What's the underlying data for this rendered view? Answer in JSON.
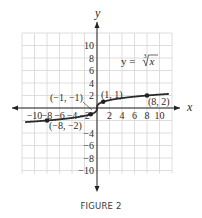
{
  "chart_data": {
    "type": "line",
    "title": "",
    "caption": "FIGURE 2",
    "xlabel": "x",
    "ylabel": "y",
    "xlim": [
      -12,
      12
    ],
    "ylim": [
      -12,
      12
    ],
    "grid": true,
    "grid_step": 2,
    "x_ticks": [
      "-10",
      "-8",
      "-6",
      "-4",
      "-2",
      "2",
      "4",
      "6",
      "8",
      "10"
    ],
    "y_ticks": [
      "10",
      "8",
      "6",
      "4",
      "2",
      "-4",
      "-6",
      "-8",
      "-10"
    ],
    "series": [
      {
        "name": "y = cube root of x",
        "label": "y = ∛x",
        "function": "cbrt",
        "x_range": [
          -11.5,
          11.5
        ]
      }
    ],
    "points": [
      {
        "x": 1,
        "y": 1,
        "label": "(1, 1)"
      },
      {
        "x": 8,
        "y": 2,
        "label": "(8, 2)"
      },
      {
        "x": -1,
        "y": -1,
        "label": "(−1, −1)"
      },
      {
        "x": -8,
        "y": -2,
        "label": "(−8, −2)"
      }
    ],
    "equation_label": "y = ∛x"
  },
  "figure": {
    "caption": "FIGURE 2",
    "x_axis_label": "x",
    "y_axis_label": "y",
    "equation": {
      "prefix": "y = ",
      "index": "3",
      "radicand": "x"
    },
    "point_labels": {
      "p1": "(1, 1)",
      "p8": "(8, 2)",
      "pm1": "(−1, −1)",
      "pm8": "(−8, −2)"
    }
  }
}
